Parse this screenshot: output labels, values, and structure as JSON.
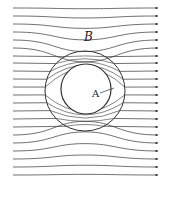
{
  "labels": {
    "field": "B",
    "inner_region": "A"
  },
  "colors": {
    "line": "#333333",
    "background": "#ffffff"
  },
  "geometry": {
    "outer_circle": {
      "cx": 85,
      "cy": 91,
      "r": 40
    },
    "inner_circle": {
      "cx": 86,
      "cy": 89,
      "r": 25
    },
    "line_start_x": 13,
    "line_end_x": 158,
    "left_y": [
      8,
      16,
      24,
      32,
      40,
      48,
      56,
      63,
      71,
      79,
      87,
      95,
      103,
      111,
      119,
      127,
      135,
      143,
      151,
      159,
      167,
      175
    ],
    "right_y": [
      8,
      16,
      24,
      32,
      40,
      48,
      56,
      63,
      71,
      79,
      87,
      95,
      103,
      111,
      119,
      127,
      135,
      143,
      151,
      159,
      167,
      175
    ]
  }
}
